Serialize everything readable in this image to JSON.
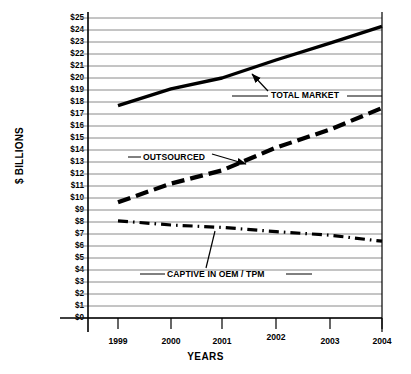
{
  "chart_data": {
    "type": "line",
    "title": "",
    "xlabel": "YEARS",
    "ylabel": "$ BILLIONS",
    "x": [
      1999,
      2000,
      2001,
      2002,
      2003,
      2004
    ],
    "xtick_labels": [
      "1999",
      "2000",
      "2001",
      "2002",
      "2003",
      "2004"
    ],
    "ytick_labels": [
      "$25",
      "$24",
      "$23",
      "$22",
      "$21",
      "$20",
      "$19",
      "$18",
      "$17",
      "$16",
      "$15",
      "$14",
      "$13",
      "$12",
      "$11",
      "$10",
      "$9",
      "$8",
      "$7",
      "$6",
      "$5",
      "$4",
      "$3",
      "$2",
      "$1",
      "$0"
    ],
    "ylim": [
      0,
      25
    ],
    "ytick_step": 1,
    "grid": "horizontal",
    "legend": "annotations-on-plot",
    "series": [
      {
        "name": "TOTAL MARKET",
        "style": "solid",
        "color": "#000000",
        "values": [
          17.7,
          19.1,
          20.0,
          21.5,
          22.9,
          24.3
        ]
      },
      {
        "name": "OUTSOURCED",
        "style": "dashed",
        "color": "#000000",
        "values": [
          9.65,
          11.2,
          12.3,
          14.2,
          15.7,
          17.5
        ]
      },
      {
        "name": "CAPTIVE IN OEM / TPM",
        "style": "dash-dot",
        "color": "#000000",
        "values": [
          8.1,
          7.75,
          7.55,
          7.2,
          6.9,
          6.4
        ]
      }
    ],
    "annotations": [
      {
        "text": "TOTAL MARKET",
        "points_to_series": "TOTAL MARKET"
      },
      {
        "text": "OUTSOURCED",
        "points_to_series": "OUTSOURCED"
      },
      {
        "text": "CAPTIVE IN OEM / TPM",
        "points_to_series": "CAPTIVE IN OEM / TPM"
      }
    ]
  },
  "axis": {
    "y_title": "$ BILLIONS",
    "x_title": "YEARS"
  },
  "labels": {
    "total_market": "TOTAL MARKET",
    "outsourced": "OUTSOURCED",
    "captive": "CAPTIVE IN OEM / TPM"
  },
  "ticks": {
    "y": [
      "$25",
      "$24",
      "$23",
      "$22",
      "$21",
      "$20",
      "$19",
      "$18",
      "$17",
      "$16",
      "$15",
      "$14",
      "$13",
      "$12",
      "$11",
      "$10",
      "$9",
      "$8",
      "$7",
      "$6",
      "$5",
      "$4",
      "$3",
      "$2",
      "$1",
      "$0"
    ],
    "x": [
      "1999",
      "2000",
      "2001",
      "2002",
      "2003",
      "2004"
    ]
  },
  "colors": {
    "line": "#000000",
    "grid": "#8a8a8a",
    "axis": "#000000",
    "background": "#ffffff"
  }
}
